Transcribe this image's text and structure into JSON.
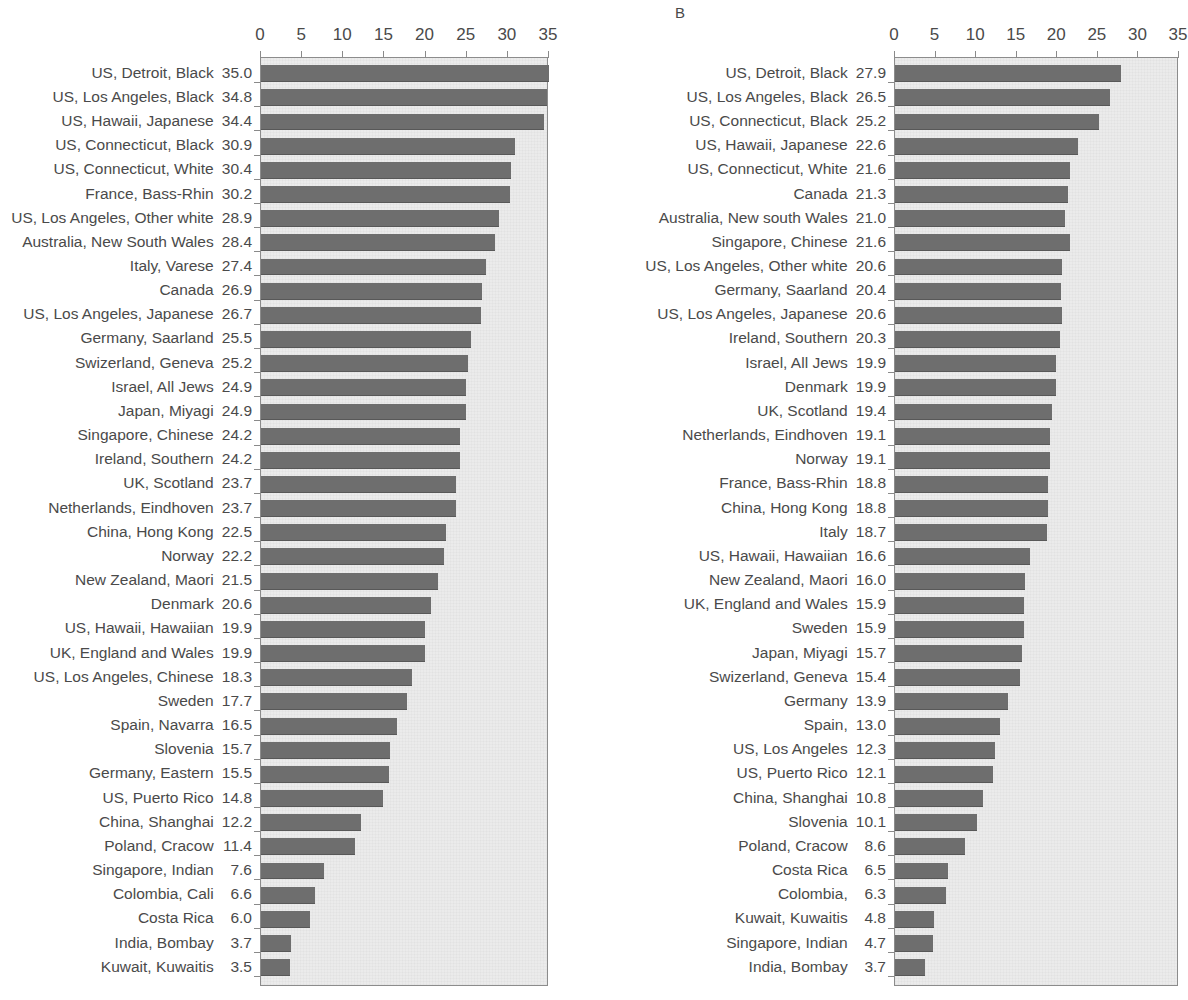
{
  "figure": {
    "panel_a_letter": "",
    "panel_b_letter": "B"
  },
  "axis": {
    "ticks": [
      0,
      5,
      10,
      15,
      20,
      25,
      30,
      35
    ],
    "min": 0,
    "max": 35
  },
  "chart_data": [
    {
      "type": "bar",
      "orientation": "horizontal",
      "panel": "A",
      "title": "",
      "xlabel": "",
      "ylabel": "",
      "xlim": [
        0,
        35
      ],
      "ticks": [
        0,
        5,
        10,
        15,
        20,
        25,
        30,
        35
      ],
      "grid": false,
      "legend": "none",
      "bar_color": "#6e6e6e",
      "plot_background": "#ebebeb",
      "categories": [
        "US, Detroit, Black",
        "US, Los Angeles, Black",
        "US, Hawaii, Japanese",
        "US, Connecticut, Black",
        "US, Connecticut, White",
        "France, Bass-Rhin",
        "US, Los Angeles, Other white",
        "Australia, New South Wales",
        "Italy, Varese",
        "Canada",
        "US, Los Angeles, Japanese",
        "Germany, Saarland",
        "Swizerland, Geneva",
        "Israel, All Jews",
        "Japan, Miyagi",
        "Singapore, Chinese",
        "Ireland, Southern",
        "UK, Scotland",
        "Netherlands, Eindhoven",
        "China, Hong Kong",
        "Norway",
        "New Zealand, Maori",
        "Denmark",
        "US, Hawaii, Hawaiian",
        "UK, England and Wales",
        "US, Los Angeles, Chinese",
        "Sweden",
        "Spain, Navarra",
        "Slovenia",
        "Germany, Eastern",
        "US, Puerto Rico",
        "China, Shanghai",
        "Poland, Cracow",
        "Singapore, Indian",
        "Colombia, Cali",
        "Costa Rica",
        "India, Bombay",
        "Kuwait, Kuwaitis"
      ],
      "values": [
        35.0,
        34.8,
        34.4,
        30.9,
        30.4,
        30.2,
        28.9,
        28.4,
        27.4,
        26.9,
        26.7,
        25.5,
        25.2,
        24.9,
        24.9,
        24.2,
        24.2,
        23.7,
        23.7,
        22.5,
        22.2,
        21.5,
        20.6,
        19.9,
        19.9,
        18.3,
        17.7,
        16.5,
        15.7,
        15.5,
        14.8,
        12.2,
        11.4,
        7.6,
        6.6,
        6.0,
        3.7,
        3.5
      ],
      "value_labels": [
        "35.0",
        "34.8",
        "34.4",
        "30.9",
        "30.4",
        "30.2",
        "28.9",
        "28.4",
        "27.4",
        "26.9",
        "26.7",
        "25.5",
        "25.2",
        "24.9",
        "24.9",
        "24.2",
        "24.2",
        "23.7",
        "23.7",
        "22.5",
        "22.2",
        "21.5",
        "20.6",
        "19.9",
        "19.9",
        "18.3",
        "17.7",
        "16.5",
        "15.7",
        "15.5",
        "14.8",
        "12.2",
        "11.4",
        "7.6",
        "6.6",
        "6.0",
        "3.7",
        "3.5"
      ]
    },
    {
      "type": "bar",
      "orientation": "horizontal",
      "panel": "B",
      "title": "B",
      "xlabel": "",
      "ylabel": "",
      "xlim": [
        0,
        35
      ],
      "ticks": [
        0,
        5,
        10,
        15,
        20,
        25,
        30,
        35
      ],
      "grid": false,
      "legend": "none",
      "bar_color": "#6e6e6e",
      "plot_background": "#ebebeb",
      "categories": [
        "US, Detroit, Black",
        "US, Los Angeles, Black",
        "US, Connecticut, Black",
        "US, Hawaii, Japanese",
        "US, Connecticut, White",
        "Canada",
        "Australia, New south Wales",
        "Singapore, Chinese",
        "US, Los Angeles, Other white",
        "Germany, Saarland",
        "US, Los Angeles, Japanese",
        "Ireland, Southern",
        "Israel, All Jews",
        "Denmark",
        "UK, Scotland",
        "Netherlands, Eindhoven",
        "Norway",
        "France, Bass-Rhin",
        "China, Hong Kong",
        "Italy",
        "US, Hawaii, Hawaiian",
        "New Zealand, Maori",
        "UK, England and Wales",
        "Sweden",
        "Japan, Miyagi",
        "Swizerland, Geneva",
        "Germany",
        "Spain,",
        "US, Los Angeles",
        "US, Puerto Rico",
        "China, Shanghai",
        "Slovenia",
        "Poland, Cracow",
        "Costa Rica",
        "Colombia,",
        "Kuwait, Kuwaitis",
        "Singapore, Indian",
        "India, Bombay"
      ],
      "values": [
        27.9,
        26.5,
        25.2,
        22.6,
        21.6,
        21.3,
        21.0,
        21.6,
        20.6,
        20.4,
        20.6,
        20.3,
        19.9,
        19.9,
        19.4,
        19.1,
        19.1,
        18.8,
        18.8,
        18.7,
        16.6,
        16.0,
        15.9,
        15.9,
        15.7,
        15.4,
        13.9,
        13.0,
        12.3,
        12.1,
        10.8,
        10.1,
        8.6,
        6.5,
        6.3,
        4.8,
        4.7,
        3.7
      ],
      "value_labels": [
        "27.9",
        "26.5",
        "25.2",
        "22.6",
        "21.6",
        "21.3",
        "21.0",
        "21.6",
        "20.6",
        "20.4",
        "20.6",
        "20.3",
        "19.9",
        "19.9",
        "19.4",
        "19.1",
        "19.1",
        "18.8",
        "18.8",
        "18.7",
        "16.6",
        "16.0",
        "15.9",
        "15.9",
        "15.7",
        "15.4",
        "13.9",
        "13.0",
        "12.3",
        "12.1",
        "10.8",
        "10.1",
        "8.6",
        "6.5",
        "6.3",
        "4.8",
        "4.7",
        "3.7"
      ]
    }
  ]
}
